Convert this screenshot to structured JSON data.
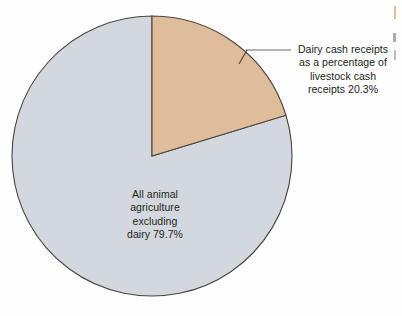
{
  "figure": {
    "background_color": "#fdfdfd",
    "text_color": "#231f20"
  },
  "callout": {
    "line_1": "Dairy cash receipts",
    "line_2": "as a percentage of",
    "line_3": "livestock cash",
    "line_4": "receipts 20.3%",
    "leader_color": "#9a9a9a"
  },
  "inner": {
    "line_1": "All animal",
    "line_2": "agriculture",
    "line_3": "excluding",
    "line_4": "dairy 79.7%"
  },
  "chart_data": {
    "type": "pie",
    "title": "",
    "xlabel": "",
    "ylabel": "",
    "legend": "none",
    "grid": false,
    "start_angle_deg": 0,
    "direction": "clockwise",
    "center": [
      152,
      156
    ],
    "radius": 140,
    "categories": [
      "Dairy cash receipts as a percentage of livestock cash receipts",
      "All animal agriculture excluding dairy"
    ],
    "values": [
      20.3,
      79.7
    ],
    "value_labels": [
      "20.3%",
      "79.7%"
    ],
    "colors": [
      "#e0bd9a",
      "#d3d8de"
    ],
    "slice_outline_color": "#4a443f",
    "units": "percent"
  }
}
